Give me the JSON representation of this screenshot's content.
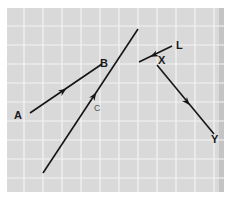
{
  "diagram": {
    "title": "",
    "background": {
      "paper": "#ffffff",
      "grid_fill": "#d9d9d9",
      "grid_line": "#f4f4f4",
      "edge_shadow": "#bdbdbd"
    },
    "grid": {
      "x0": 7,
      "y0": 8,
      "x1": 224,
      "y1": 192,
      "spacing": 19
    },
    "vectors": [
      {
        "id": "AB",
        "from": "A",
        "to": "B",
        "x1": 30,
        "y1": 113,
        "x2": 102,
        "y2": 64,
        "arrow": {
          "x": 63,
          "y": 91,
          "direction": "A-to-B"
        }
      },
      {
        "id": "C",
        "label": "C",
        "x1": 43,
        "y1": 173,
        "x2": 138,
        "y2": 29,
        "arrow": {
          "x": 94,
          "y": 96,
          "direction": "up"
        }
      },
      {
        "id": "LX",
        "from": "L",
        "to": "X",
        "x1": 172,
        "y1": 46,
        "x2": 139,
        "y2": 62,
        "arrow": {
          "x": 154,
          "y": 55,
          "direction": "L-to-X"
        }
      },
      {
        "id": "XY",
        "from": "X",
        "to": "Y",
        "x1": 157,
        "y1": 65,
        "x2": 214,
        "y2": 134,
        "arrow": {
          "x": 187,
          "y": 102,
          "direction": "X-to-Y"
        }
      }
    ],
    "labels": [
      {
        "text": "A",
        "x": 14,
        "y": 119
      },
      {
        "text": "B",
        "x": 104,
        "y": 66
      },
      {
        "text": "C",
        "x": 94,
        "y": 111
      },
      {
        "text": "L",
        "x": 176,
        "y": 49
      },
      {
        "text": "X",
        "x": 159,
        "y": 64
      },
      {
        "text": "Y",
        "x": 213,
        "y": 142
      }
    ],
    "line_color": "#151515"
  }
}
